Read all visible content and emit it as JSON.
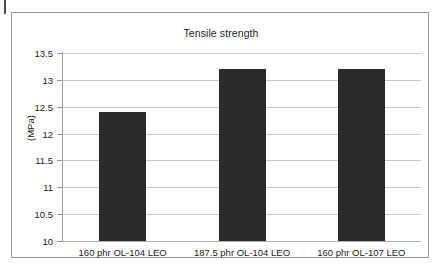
{
  "figure": {
    "frame_border_color": "#9a9a9a",
    "background": "#ffffff"
  },
  "chart_data": {
    "type": "bar",
    "title": "Tensile strength",
    "xlabel": "",
    "ylabel": "(MPa)",
    "categories": [
      "160 phr OL-104 LEO",
      "187.5 phr OL-104 LEO",
      "160 phr OL-107 LEO"
    ],
    "values": [
      12.4,
      13.2,
      13.2
    ],
    "ylim": [
      10,
      13.5
    ],
    "ytick_labels": [
      "13.5",
      "13",
      "12.5",
      "12",
      "11.5",
      "11",
      "10.5",
      "10"
    ],
    "ytick_values": [
      13.5,
      13,
      12.5,
      12,
      11.5,
      11,
      10.5,
      10
    ],
    "grid": true,
    "legend": null,
    "bar_color": "#2b2b2b",
    "gridline_color": "#c9c9c9",
    "axis_color": "#9a9a9a"
  }
}
